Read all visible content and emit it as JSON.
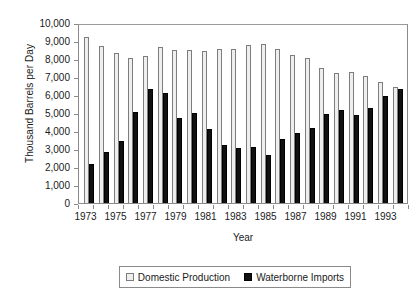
{
  "chart_data": {
    "type": "bar",
    "title": "",
    "xlabel": "Year",
    "ylabel": "Thousand Barrels per Day",
    "ylim": [
      0,
      10000
    ],
    "ytick_step": 1000,
    "ytick_labels": [
      "10,000",
      "9,000",
      "8,000",
      "7,000",
      "6,000",
      "5,000",
      "4,000",
      "3,000",
      "2,000",
      "1,000",
      "0"
    ],
    "grid": false,
    "legend_position": "bottom-center",
    "xtick_labels": [
      "1973",
      "1975",
      "1977",
      "1979",
      "1981",
      "1983",
      "1985",
      "1987",
      "1989",
      "1991",
      "1993"
    ],
    "categories": [
      "1973",
      "1974",
      "1975",
      "1976",
      "1977",
      "1978",
      "1979",
      "1980",
      "1981",
      "1982",
      "1983",
      "1984",
      "1985",
      "1986",
      "1987",
      "1988",
      "1989",
      "1990",
      "1991",
      "1992",
      "1993",
      "1994"
    ],
    "series": [
      {
        "name": "Domestic Production",
        "color": "#eeeeee",
        "values": [
          9200,
          8730,
          8350,
          8080,
          8180,
          8660,
          8500,
          8520,
          8470,
          8580,
          8570,
          8760,
          8830,
          8560,
          8240,
          8080,
          7500,
          7220,
          7300,
          7060,
          6720,
          6430
        ]
      },
      {
        "name": "Waterborne Imports",
        "color": "#111111",
        "values": [
          2180,
          2830,
          3440,
          5080,
          6330,
          6120,
          4710,
          4980,
          4120,
          3200,
          3030,
          3130,
          2680,
          3560,
          3880,
          4160,
          4920,
          5160,
          4870,
          5300,
          5950,
          6330
        ]
      }
    ]
  },
  "legend": {
    "entries": [
      {
        "label": "Domestic Production"
      },
      {
        "label": "Waterborne Imports"
      }
    ]
  }
}
